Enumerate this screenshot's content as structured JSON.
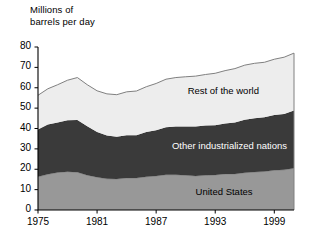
{
  "chart": {
    "axis_title": "Millions of\nbarrels per day",
    "y_ticks": [
      "0",
      "10",
      "20",
      "30",
      "40",
      "50",
      "60",
      "70",
      "80"
    ],
    "x_ticks": [
      "1975",
      "1981",
      "1987",
      "1993",
      "1999"
    ],
    "series_labels": {
      "rest_of_world": "Rest of the world",
      "other_industrialized": "Other industrialized nations",
      "united_states": "United States"
    },
    "colors": {
      "rest_of_world": "#ededed",
      "other_industrialized": "#3a3a3a",
      "united_states": "#989898",
      "axis": "#000000",
      "outline": "#808080"
    }
  },
  "chart_data": {
    "type": "area",
    "title": "Millions of barrels per day",
    "xlabel": "",
    "ylabel": "Millions of barrels per day",
    "stacked": true,
    "grid": false,
    "legend": "inline-labels",
    "xlim": [
      1975,
      2001
    ],
    "ylim": [
      0,
      80
    ],
    "x_tick_values": [
      1975,
      1981,
      1987,
      1993,
      1999
    ],
    "y_tick_values": [
      0,
      10,
      20,
      30,
      40,
      50,
      60,
      70,
      80
    ],
    "x": [
      1975,
      1976,
      1977,
      1978,
      1979,
      1980,
      1981,
      1982,
      1983,
      1984,
      1985,
      1986,
      1987,
      1988,
      1989,
      1990,
      1991,
      1992,
      1993,
      1994,
      1995,
      1996,
      1997,
      1998,
      1999,
      2000,
      2001
    ],
    "series": [
      {
        "name": "United States",
        "values": [
          16.3,
          17.5,
          18.4,
          18.8,
          18.5,
          17.1,
          16.1,
          15.3,
          15.2,
          15.7,
          15.7,
          16.3,
          16.7,
          17.3,
          17.3,
          17.0,
          16.7,
          17.0,
          17.2,
          17.7,
          17.7,
          18.3,
          18.6,
          18.9,
          19.5,
          19.7,
          20.5
        ]
      },
      {
        "name": "Other industrialized nations",
        "values": [
          23.2,
          24.5,
          24.6,
          25.3,
          25.7,
          24.0,
          22.2,
          21.3,
          20.7,
          21.0,
          21.0,
          22.0,
          22.4,
          23.3,
          23.7,
          24.0,
          24.3,
          24.5,
          24.4,
          24.8,
          25.3,
          26.0,
          26.4,
          26.6,
          27.1,
          27.4,
          28.3
        ]
      },
      {
        "name": "Rest of the world",
        "values": [
          16.8,
          17.5,
          18.5,
          19.6,
          20.8,
          20.4,
          20.2,
          20.4,
          20.7,
          21.3,
          21.7,
          22.2,
          23.0,
          23.6,
          24.0,
          24.4,
          24.7,
          25.0,
          25.5,
          25.9,
          26.4,
          26.8,
          27.0,
          27.0,
          27.4,
          27.9,
          28.2
        ]
      }
    ],
    "totals": [
      56.3,
      59.5,
      61.5,
      63.7,
      65.0,
      61.5,
      58.5,
      57.0,
      56.6,
      58.0,
      58.4,
      60.5,
      62.1,
      64.2,
      65.0,
      65.4,
      65.7,
      66.5,
      67.1,
      68.4,
      69.4,
      71.1,
      72.0,
      72.5,
      74.0,
      75.0,
      77.0
    ]
  }
}
